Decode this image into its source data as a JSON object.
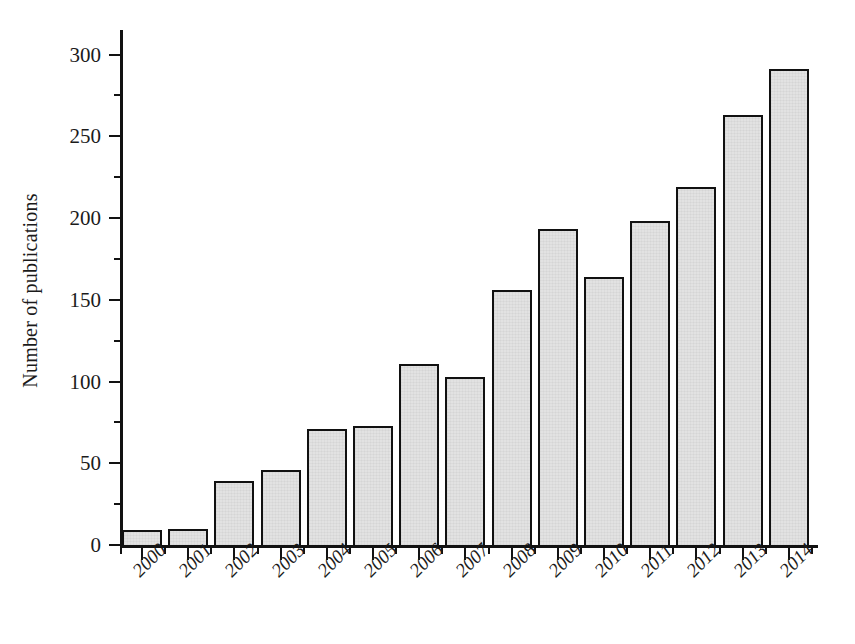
{
  "chart_data": {
    "type": "bar",
    "title": "",
    "xlabel": "",
    "ylabel": "Number of publications",
    "categories": [
      "2000",
      "2001",
      "2002",
      "2003",
      "2004",
      "2005",
      "2006",
      "2007",
      "2008",
      "2009",
      "2010",
      "2011",
      "2012",
      "2013",
      "2014"
    ],
    "values": [
      9,
      10,
      39,
      46,
      71,
      73,
      111,
      103,
      156,
      193,
      164,
      198,
      219,
      263,
      291
    ],
    "ylim": [
      0,
      315
    ],
    "y_major_ticks": [
      0,
      50,
      100,
      150,
      200,
      250,
      300
    ],
    "y_major_tick_labels": [
      "0",
      "50",
      "100",
      "150",
      "200",
      "250",
      "300"
    ],
    "y_minor_tick_interval": 25,
    "grid": false,
    "legend": false,
    "legend_position": "none",
    "bar_fill_color": "#e2e2e2",
    "bar_edge_color": "#111111",
    "axis_color": "#121212",
    "xtick_label_rotation": -45,
    "xtick_label_style": "italic"
  },
  "axes": {
    "y_title": "Number of publications"
  }
}
